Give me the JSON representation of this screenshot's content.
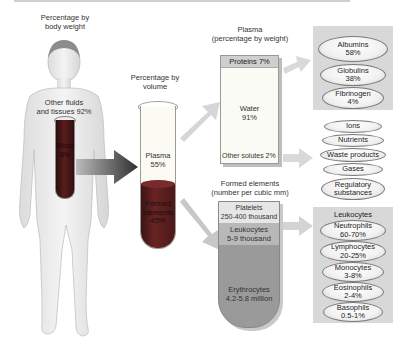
{
  "figure": {
    "title_labels": {
      "body_weight": "Percentage by\nbody weight",
      "volume": "Percentage by\nvolume",
      "plasma": "Plasma\n(percentage by weight)",
      "formed": "Formed elements\n(number per cubic mm)"
    },
    "body": {
      "other": "Other fluids\nand tissues 92%",
      "blood": "Blood\n8%"
    },
    "tube": {
      "plasma": "Plasma\n55%",
      "formed": "Formed\nelements\n45%"
    },
    "plasma_composition": {
      "proteins": "Proteins 7%",
      "water": "Water\n91%",
      "other_solutes": "Other solutes 2%"
    },
    "proteins_breakdown": [
      {
        "name": "Albumins",
        "value": "58%"
      },
      {
        "name": "Globulins",
        "value": "38%"
      },
      {
        "name": "Fibrinogen",
        "value": "4%"
      }
    ],
    "other_solutes_breakdown": [
      "Ions",
      "Nutrients",
      "Waste products",
      "Gases",
      "Regulatory\nsubstances"
    ],
    "formed_elements": {
      "platelets": "Platelets\n250-400 thousand",
      "leukocytes": "Leukocytes\n5-9 thousand",
      "erythrocytes": "Erythrocytes\n4.2-5.8 million"
    },
    "leukocytes_panel": {
      "title": "Leukocytes",
      "items": [
        {
          "name": "Neutrophils",
          "value": "60-70%"
        },
        {
          "name": "Lymphocytes",
          "value": "20-25%"
        },
        {
          "name": "Monocytes",
          "value": "3-8%"
        },
        {
          "name": "Eosinophils",
          "value": "2-4%"
        },
        {
          "name": "Basophils",
          "value": "0.5-1%"
        }
      ]
    },
    "colors": {
      "blood": "#5a1c1c",
      "panel": "#d8d8d8",
      "arrow_dark": "#3a3a3a",
      "arrow_light": "#d0d0d0"
    }
  }
}
